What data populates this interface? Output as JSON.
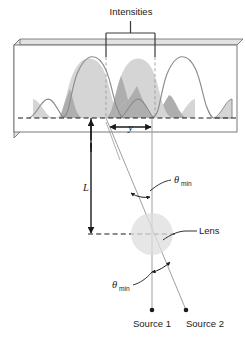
{
  "figure": {
    "title_label": "Intensities",
    "labels": {
      "separation": "y",
      "distance": "L",
      "lens": "Lens",
      "theta_symbol": "θ",
      "theta_subscript": "min",
      "source_1": "Source 1",
      "source_2": "Source 2"
    },
    "caption_fragment": "",
    "colors": {
      "curve_fill": "#d5d5d5",
      "curve_overlap_fill": "#aeaeae",
      "curve_stroke": "#8c8c8c",
      "screen_border": "#6b6b6b",
      "screen_face": "#ffffff",
      "screen_edge": "#b5b5b5",
      "axis_dashed": "#1a1a1a",
      "ray_line": "#9a9a9a",
      "lens_fill": "#dedede",
      "annotation": "#1a1a1a",
      "text": "#1a1a1a",
      "background": "#ffffff"
    },
    "geometry": {
      "peak_1_x": 106,
      "peak_2_x": 155,
      "baseline_y": 118,
      "lens_center_x": 152,
      "lens_center_y": 234,
      "lens_radius": 21,
      "source_1_x": 152,
      "source_1_y": 310,
      "source_2_x": 186,
      "source_2_y": 310,
      "bracket_left_x": 106,
      "bracket_right_x": 155,
      "bracket_y": 33,
      "screen_left": 14,
      "screen_right": 237,
      "screen_top": 45,
      "screen_bottom": 132
    }
  }
}
